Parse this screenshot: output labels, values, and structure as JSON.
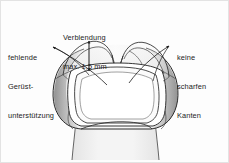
{
  "figure": {
    "language": "de",
    "background_color": "#fdfdfd",
    "frame_color": "#e3e3e3",
    "line_color": "#1c1c1c",
    "text_color": "#1c1c1c"
  },
  "annotations": {
    "left": {
      "name": "fehlende-geruestunterstuetzung",
      "line1": "fehlende",
      "line2": "Gerüst-",
      "line3": "unterstützung"
    },
    "top": {
      "name": "verblendung-staerke",
      "line1": "Verblendung",
      "line2": "max. 1,5 mm"
    },
    "right": {
      "name": "keine-scharfen-kanten",
      "line1": "keine",
      "line2": "scharfen",
      "line3": "Kanten"
    }
  },
  "measurement": {
    "value": "1,5",
    "unit": "mm",
    "qualifier": "max.",
    "full_text": "max. 1,5 mm"
  },
  "drawing": {
    "subject": "molar-crown-cross-section",
    "shading": {
      "flank_dark": "#8c8c8c",
      "flank_mid": "#b9b9b9",
      "flank_light": "#e6e6e6",
      "body_light": "#f6f6f6",
      "core_white": "#ffffff"
    },
    "elements": [
      "tooth-outline",
      "occlusal-cusps",
      "veneer-layer",
      "coping-framework",
      "cervical-margin",
      "root-stump"
    ]
  }
}
